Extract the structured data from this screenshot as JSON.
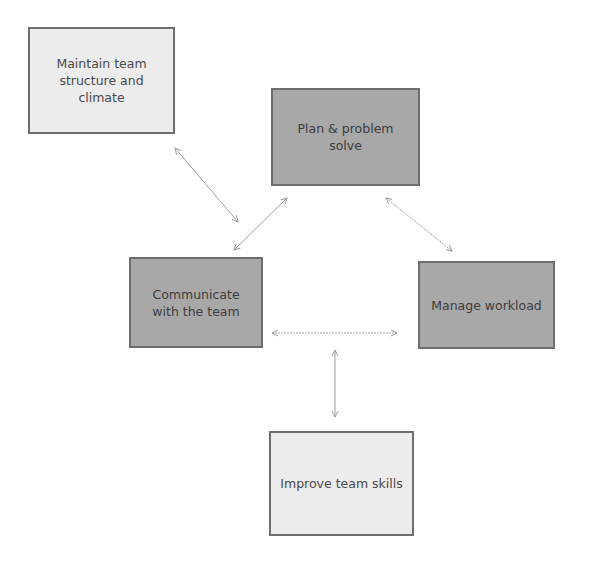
{
  "diagram": {
    "nodes": [
      {
        "id": "maintain",
        "label": "Maintain team structure and climate",
        "style": "light"
      },
      {
        "id": "plan",
        "label": "Plan & problem solve",
        "style": "dark"
      },
      {
        "id": "communicate",
        "label": "Communicate with the team",
        "style": "dark"
      },
      {
        "id": "manage",
        "label": "Manage workload",
        "style": "dark"
      },
      {
        "id": "improve",
        "label": "Improve team skills",
        "style": "light"
      }
    ],
    "edges": [
      {
        "from": "maintain",
        "to": "communicate",
        "type": "bidirectional"
      },
      {
        "from": "plan",
        "to": "communicate",
        "type": "bidirectional"
      },
      {
        "from": "plan",
        "to": "manage",
        "type": "bidirectional"
      },
      {
        "from": "communicate",
        "to": "manage",
        "type": "bidirectional"
      },
      {
        "from": "communicate-manage-link",
        "to": "improve",
        "type": "bidirectional"
      }
    ],
    "colors": {
      "light_fill": "#ececec",
      "dark_fill": "#a8a8a8",
      "border": "#6e6e6e",
      "arrow": "#9a9a9a"
    }
  }
}
